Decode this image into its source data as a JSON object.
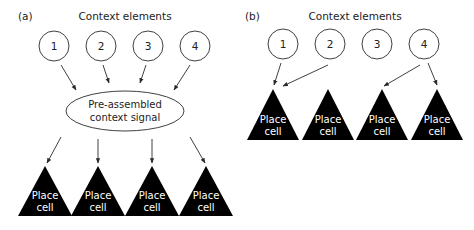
{
  "panel_a": {
    "label": "(a)",
    "heading": "Context elements",
    "elements": [
      "1",
      "2",
      "3",
      "4"
    ],
    "integrator": {
      "line1": "Pre-assembled",
      "line2": "context signal"
    },
    "cells": [
      {
        "line1": "Place",
        "line2": "cell"
      },
      {
        "line1": "Place",
        "line2": "cell"
      },
      {
        "line1": "Place",
        "line2": "cell"
      },
      {
        "line1": "Place",
        "line2": "cell"
      }
    ]
  },
  "panel_b": {
    "label": "(b)",
    "heading": "Context elements",
    "elements": [
      "1",
      "2",
      "3",
      "4"
    ],
    "cells": [
      {
        "line1": "Place",
        "line2": "cell"
      },
      {
        "line1": "Place",
        "line2": "cell"
      },
      {
        "line1": "Place",
        "line2": "cell"
      },
      {
        "line1": "Place",
        "line2": "cell"
      }
    ],
    "connections": [
      {
        "from_element": "1",
        "to_cell": 1
      },
      {
        "from_element": "2",
        "to_cell": 1
      },
      {
        "from_element": "4",
        "to_cell": 3
      },
      {
        "from_element": "4",
        "to_cell": 4
      }
    ]
  },
  "colors": {
    "stroke": "#2a2a2a",
    "cell_fill": "#000000",
    "cell_text": "#ffffff",
    "background": "#ffffff"
  }
}
